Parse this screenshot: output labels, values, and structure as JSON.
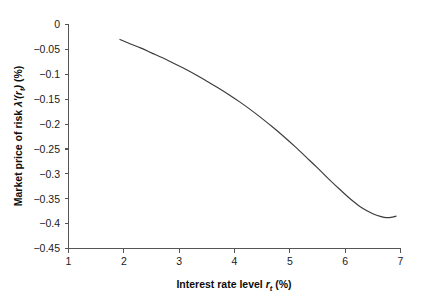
{
  "chart_data": {
    "type": "line",
    "title": "",
    "xlabel": "Interest rate level r_t (%)",
    "ylabel": "Market price of risk λ'(r_t) (%)",
    "xlim": [
      1,
      7
    ],
    "ylim": [
      -0.45,
      0
    ],
    "xticks": [
      1,
      2,
      3,
      4,
      5,
      6,
      7
    ],
    "yticks": [
      0,
      -0.05,
      -0.1,
      -0.15,
      -0.2,
      -0.25,
      -0.3,
      -0.35,
      -0.4,
      -0.45
    ],
    "xtick_labels": [
      "1",
      "2",
      "3",
      "4",
      "5",
      "6",
      "7"
    ],
    "ytick_labels": [
      "0",
      "−0.05",
      "−0.1",
      "−0.15",
      "−0.2",
      "−0.25",
      "−0.3",
      "−0.35",
      "−0.4",
      "−0.45"
    ],
    "grid": false,
    "legend": false,
    "series": [
      {
        "name": "Market price of risk",
        "color": "#3b3b3b",
        "x": [
          1.93,
          2.1,
          2.3,
          2.5,
          2.7,
          2.9,
          3.1,
          3.3,
          3.5,
          3.7,
          3.9,
          4.1,
          4.3,
          4.5,
          4.7,
          4.9,
          5.1,
          5.3,
          5.5,
          5.7,
          5.9,
          6.1,
          6.3,
          6.5,
          6.65,
          6.75,
          6.85,
          6.92
        ],
        "y": [
          -0.03,
          -0.038,
          -0.047,
          -0.057,
          -0.067,
          -0.078,
          -0.089,
          -0.101,
          -0.114,
          -0.127,
          -0.141,
          -0.156,
          -0.172,
          -0.189,
          -0.207,
          -0.226,
          -0.246,
          -0.267,
          -0.288,
          -0.31,
          -0.331,
          -0.351,
          -0.368,
          -0.38,
          -0.386,
          -0.388,
          -0.387,
          -0.385
        ]
      }
    ]
  },
  "axis": {
    "x_title_main": "Interest rate level ",
    "x_title_var": "r",
    "x_title_sub": "t",
    "x_title_unit": " (%)",
    "y_title_main": "Market price of risk ",
    "y_title_lambda": "λ'(",
    "y_title_var": "r",
    "y_title_sub": "t",
    "y_title_close": ")",
    "y_title_unit": " (%)"
  },
  "colors": {
    "curve": "#3b3b3b",
    "axis": "#555555",
    "text": "#1a1a1a",
    "background": "#ffffff"
  }
}
